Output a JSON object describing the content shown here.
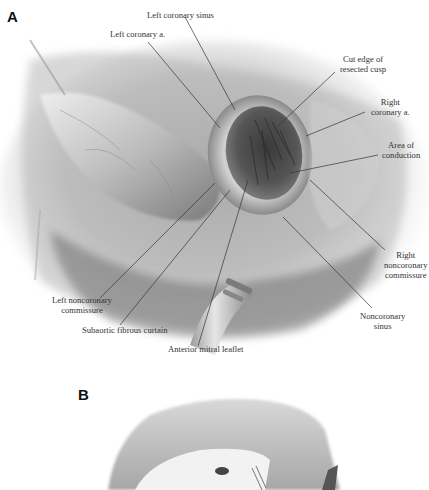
{
  "figure": {
    "panel_a": {
      "letter": "A",
      "labels": {
        "left_coronary_sinus": "Left coronary sinus",
        "left_coronary_a": "Left coronary a.",
        "cut_edge_line1": "Cut edge of",
        "cut_edge_line2": "resected cusp",
        "right_coronary_line1": "Right",
        "right_coronary_line2": "coronary a.",
        "area_conduction_line1": "Area of",
        "area_conduction_line2": "conduction",
        "right_noncoronary_line1": "Right",
        "right_noncoronary_line2": "noncoronary",
        "right_noncoronary_line3": "commissure",
        "left_noncoronary_line1": "Left noncoronary",
        "left_noncoronary_line2": "commissure",
        "subaortic": "Subaortic fibrous curtain",
        "anterior_mitral": "Anterior mitral leaflet",
        "noncoronary_sinus_line1": "Noncoronary",
        "noncoronary_sinus_line2": "sinus"
      }
    },
    "panel_b": {
      "letter": "B"
    }
  }
}
